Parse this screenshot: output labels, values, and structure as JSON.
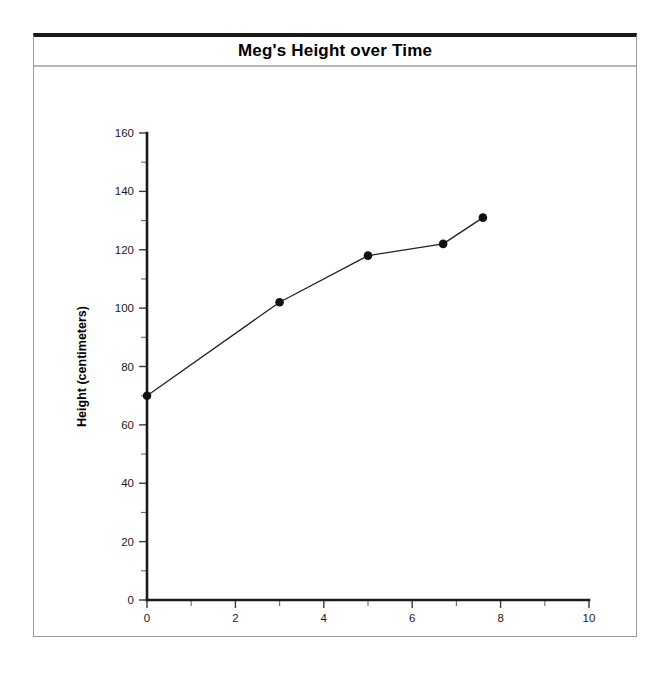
{
  "card": {
    "title": "Meg's Height over Time"
  },
  "chart_data": {
    "type": "line",
    "title": "Meg's Height over Time",
    "xlabel": "Age (years)",
    "ylabel": "Height (centimeters)",
    "xlim": [
      0,
      10
    ],
    "ylim": [
      0,
      160
    ],
    "grid": false,
    "legend": false,
    "x_major_ticks": [
      0,
      2,
      4,
      6,
      8,
      10
    ],
    "x_major_tick_labels": [
      "0",
      "2",
      "4",
      "6",
      "8",
      "10"
    ],
    "x_minor_ticks": [
      1,
      3,
      5,
      7,
      9
    ],
    "y_major_ticks": [
      0,
      20,
      40,
      60,
      80,
      100,
      120,
      140,
      160
    ],
    "y_major_tick_labels": [
      "0",
      "20",
      "40",
      "60",
      "80",
      "100",
      "120",
      "140",
      "160"
    ],
    "y_minor_ticks": [
      10,
      30,
      50,
      70,
      90,
      110,
      130,
      150
    ],
    "series": [
      {
        "name": "Meg's height",
        "marker": "filled-circle",
        "color": "#111111",
        "points": [
          {
            "x": 0,
            "y": 70
          },
          {
            "x": 3,
            "y": 102
          },
          {
            "x": 5,
            "y": 118
          },
          {
            "x": 6.7,
            "y": 122
          },
          {
            "x": 7.6,
            "y": 131
          }
        ]
      }
    ]
  }
}
